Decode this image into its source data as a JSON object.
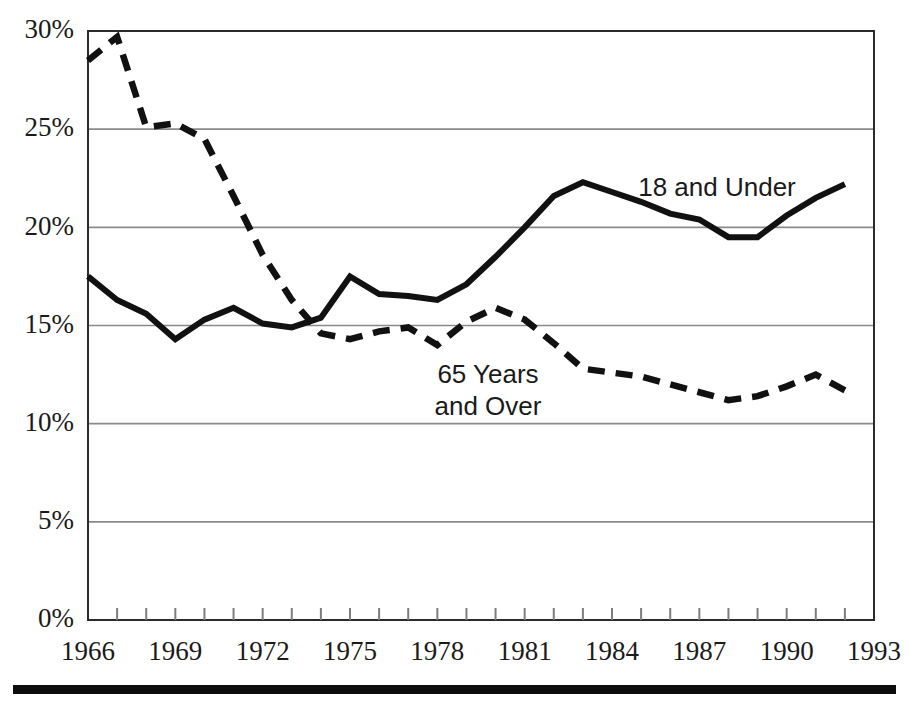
{
  "chart_data": {
    "type": "line",
    "title": "",
    "subtitle": "",
    "xlabel": "",
    "ylabel": "",
    "xlim": [
      1966,
      1993
    ],
    "ylim": [
      0,
      30
    ],
    "grid": true,
    "grid_axis": "y",
    "legend_position": "inline-annotation",
    "y_tick_labels": [
      "30%",
      "25%",
      "20%",
      "15%",
      "10%",
      "5%",
      "0%"
    ],
    "y_tick_values": [
      30,
      25,
      20,
      15,
      10,
      5,
      0
    ],
    "x_tick_labels": [
      "1966",
      "1969",
      "1972",
      "1975",
      "1978",
      "1981",
      "1984",
      "1987",
      "1990",
      "1993"
    ],
    "x_tick_values": [
      1966,
      1969,
      1972,
      1975,
      1978,
      1981,
      1984,
      1987,
      1990,
      1993
    ],
    "x_minor_ticks": [
      1966,
      1967,
      1968,
      1969,
      1970,
      1971,
      1972,
      1973,
      1974,
      1975,
      1976,
      1977,
      1978,
      1979,
      1980,
      1981,
      1982,
      1983,
      1984,
      1985,
      1986,
      1987,
      1988,
      1989,
      1990,
      1991,
      1992,
      1993
    ],
    "x": [
      1966,
      1967,
      1968,
      1969,
      1970,
      1971,
      1972,
      1973,
      1974,
      1975,
      1976,
      1977,
      1978,
      1979,
      1980,
      1981,
      1982,
      1983,
      1984,
      1985,
      1986,
      1987,
      1988,
      1989,
      1990,
      1991,
      1992
    ],
    "series": [
      {
        "name": "18 and Under",
        "style": "solid",
        "color": "#111111",
        "values": [
          17.5,
          16.3,
          15.6,
          14.3,
          15.3,
          15.9,
          15.1,
          14.9,
          15.4,
          17.5,
          16.6,
          16.5,
          16.3,
          17.1,
          18.5,
          20.0,
          21.6,
          22.3,
          21.8,
          21.3,
          20.7,
          20.4,
          19.5,
          19.5,
          20.6,
          21.5,
          22.2
        ]
      },
      {
        "name": "65 Years and Over",
        "style": "dashed",
        "color": "#111111",
        "values": [
          28.5,
          29.7,
          25.1,
          25.3,
          24.5,
          21.6,
          18.6,
          16.3,
          14.6,
          14.3,
          14.7,
          14.9,
          14.0,
          15.2,
          15.9,
          15.3,
          14.1,
          12.8,
          12.6,
          12.4,
          12.0,
          11.6,
          11.2,
          11.4,
          11.9,
          12.5,
          11.7
        ]
      }
    ],
    "annotations": [
      {
        "name": "18 and Under",
        "lines": [
          "18 and Under"
        ],
        "x": 1985.3,
        "y": 22.5
      },
      {
        "name": "65 Years and Over",
        "lines": [
          "65 Years",
          "and Over"
        ],
        "x": 1978.2,
        "y": 13.2
      }
    ]
  },
  "annotations": {
    "solid_label": "18 and Under",
    "dashed_label_line1": "65 Years",
    "dashed_label_line2": "and Over"
  },
  "y_axis": {
    "t0": "30%",
    "t1": "25%",
    "t2": "20%",
    "t3": "15%",
    "t4": "10%",
    "t5": "5%",
    "t6": "0%"
  },
  "x_axis": {
    "t0": "1966",
    "t1": "1969",
    "t2": "1972",
    "t3": "1975",
    "t4": "1978",
    "t5": "1981",
    "t6": "1984",
    "t7": "1987",
    "t8": "1990",
    "t9": "1993"
  },
  "colors": {
    "line": "#111111",
    "grid": "#8a8a8a",
    "frame": "#2b2b2b",
    "text": "#1a1a1a",
    "background": "#ffffff"
  }
}
